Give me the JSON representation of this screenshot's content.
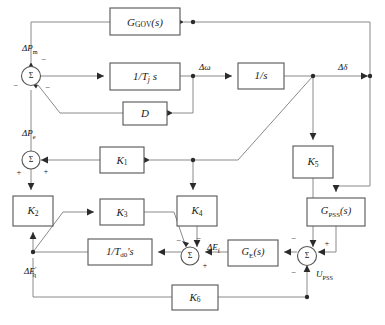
{
  "diagram": {
    "type": "control-block-diagram",
    "canvas": {
      "width": 385,
      "height": 325
    },
    "colors": {
      "background": "#ffffff",
      "block_stroke": "#555555",
      "block_fill": "#ffffff",
      "wire": "#8a8a8a",
      "node": "#2b2b2b",
      "text": "#1a1a1a"
    },
    "blocks": [
      {
        "id": "ggov",
        "label": "G",
        "sub": "GOV",
        "tail": "(s)",
        "x": 110,
        "y": 8,
        "w": 70,
        "h": 27
      },
      {
        "id": "tj",
        "label": "1/T",
        "sub": "j",
        "tail": " s",
        "x": 110,
        "y": 63,
        "w": 70,
        "h": 27
      },
      {
        "id": "d",
        "label": "D",
        "sub": "",
        "tail": "",
        "x": 123,
        "y": 102,
        "w": 44,
        "h": 23
      },
      {
        "id": "invs",
        "label": "1/s",
        "sub": "",
        "tail": "",
        "x": 238,
        "y": 63,
        "w": 46,
        "h": 26
      },
      {
        "id": "k1",
        "label": "K",
        "sub": "1",
        "tail": "",
        "x": 100,
        "y": 147,
        "w": 44,
        "h": 26
      },
      {
        "id": "k2",
        "label": "K",
        "sub": "2",
        "tail": "",
        "x": 13,
        "y": 196,
        "w": 40,
        "h": 30
      },
      {
        "id": "k3",
        "label": "K",
        "sub": "3",
        "tail": "",
        "x": 100,
        "y": 199,
        "w": 44,
        "h": 26
      },
      {
        "id": "k4",
        "label": "K",
        "sub": "4",
        "tail": "",
        "x": 177,
        "y": 196,
        "w": 40,
        "h": 30
      },
      {
        "id": "td0",
        "label": "1/T",
        "sub": "d0",
        "tail": "' s",
        "x": 88,
        "y": 239,
        "w": 64,
        "h": 26
      },
      {
        "id": "ge",
        "label": "G",
        "sub": "E",
        "tail": "(s)",
        "x": 228,
        "y": 240,
        "w": 50,
        "h": 26
      },
      {
        "id": "k5",
        "label": "K",
        "sub": "5",
        "tail": "",
        "x": 293,
        "y": 146,
        "w": 40,
        "h": 32
      },
      {
        "id": "gpss",
        "label": "G",
        "sub": "PSS",
        "tail": "(s)",
        "x": 307,
        "y": 198,
        "w": 58,
        "h": 28
      },
      {
        "id": "k6",
        "label": "K",
        "sub": "6",
        "tail": "",
        "x": 172,
        "y": 285,
        "w": 46,
        "h": 25
      }
    ],
    "summers": [
      {
        "id": "sum-pm",
        "symbol": "Σ",
        "cx": 31,
        "cy": 76,
        "r": 9.5,
        "signs": [
          {
            "s": "−",
            "x": 42,
            "y": 60
          },
          {
            "s": "−",
            "x": 17,
            "y": 86
          },
          {
            "s": "−",
            "x": 46,
            "y": 87
          }
        ]
      },
      {
        "id": "sum-pe",
        "symbol": "Σ",
        "cx": 31,
        "cy": 160,
        "r": 9.0,
        "signs": [
          {
            "s": "+",
            "x": 45,
            "y": 171
          },
          {
            "s": "+",
            "x": 20,
            "y": 172
          }
        ]
      },
      {
        "id": "sum-ef",
        "symbol": "Σ",
        "cx": 190,
        "cy": 256,
        "r": 9.0,
        "signs": [
          {
            "s": "−",
            "x": 179,
            "y": 241
          },
          {
            "s": "−",
            "x": 198,
            "y": 240
          },
          {
            "s": "+",
            "x": 203,
            "y": 266
          }
        ]
      },
      {
        "id": "sum-upss",
        "symbol": "Σ",
        "cx": 307,
        "cy": 256,
        "r": 9.5,
        "signs": [
          {
            "s": "−",
            "x": 295,
            "y": 240
          },
          {
            "s": "+",
            "x": 325,
            "y": 246
          },
          {
            "s": "−",
            "x": 295,
            "y": 272
          }
        ]
      }
    ],
    "signal_labels": [
      {
        "id": "dpm",
        "main": "ΔP",
        "sub": "m",
        "sup": "",
        "x": 26,
        "y": 48
      },
      {
        "id": "dpe",
        "main": "ΔP",
        "sub": "e",
        "sup": "",
        "x": 26,
        "y": 133
      },
      {
        "id": "domega",
        "main": "Δω",
        "sub": "",
        "sup": "",
        "x": 199,
        "y": 69
      },
      {
        "id": "ddelta",
        "main": "Δδ",
        "sub": "",
        "sup": "",
        "x": 338,
        "y": 69
      },
      {
        "id": "deq",
        "main": "ΔE",
        "sub": "q",
        "sup": "'",
        "x": 28,
        "y": 272
      },
      {
        "id": "def",
        "main": "ΔE",
        "sub": "f",
        "sup": "",
        "x": 205,
        "y": 249
      },
      {
        "id": "upss",
        "main": "U",
        "sub": "PSS",
        "sup": "",
        "x": 316,
        "y": 274
      }
    ],
    "nodes": [
      {
        "id": "n-omega",
        "x": 193,
        "y": 76
      },
      {
        "id": "n-gov",
        "x": 193,
        "y": 22
      },
      {
        "id": "n-k1",
        "x": 193,
        "y": 160
      },
      {
        "id": "n-delta",
        "x": 313,
        "y": 76
      },
      {
        "id": "n-deq",
        "x": 33,
        "y": 252
      },
      {
        "id": "n-upss",
        "x": 307,
        "y": 297
      }
    ]
  }
}
